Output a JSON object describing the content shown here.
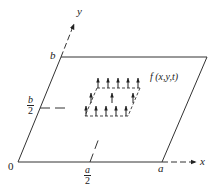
{
  "diagram": {
    "type": "plate with distributed vertical force arrows",
    "colors": {
      "line": "#333333",
      "background": "#ffffff"
    },
    "labels": {
      "origin": "0",
      "x_axis": "x",
      "y_axis": "y",
      "x_end": "a",
      "x_mid_num": "a",
      "x_mid_den": "2",
      "y_end": "b",
      "y_mid_num": "b",
      "y_mid_den": "2",
      "load": "f (x,y,t)"
    },
    "arrows": {
      "back_row_count": 5,
      "middle_row_count": 3,
      "front_row_count": 5
    }
  }
}
